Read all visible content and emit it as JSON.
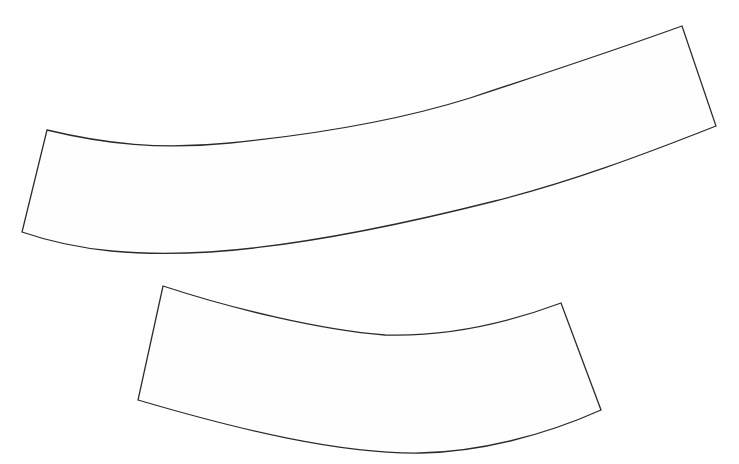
{
  "canvas": {
    "width": 739,
    "height": 464,
    "background": "#ffffff"
  },
  "style": {
    "stroke_color": "#2a2a2a",
    "fill_color": "#fefefe"
  },
  "shapes": [
    {
      "id": "upper-band",
      "description": "long curved band, rising to the right",
      "corners": {
        "top_left": [
          47,
          130
        ],
        "top_right": [
          682,
          26
        ],
        "bottom_right": [
          716,
          126
        ],
        "bottom_left": [
          22,
          232
        ]
      },
      "path": "M47,130 C105,144 160,150 230,143 C320,134 400,120 470,98 C540,75 610,52 682,26 L716,126 C640,156 570,182 495,201 C400,225 300,246 210,252 C140,256 80,252 22,232 Z"
    },
    {
      "id": "lower-band",
      "description": "shorter curved band, sagging in the middle",
      "corners": {
        "top_left": [
          163,
          286
        ],
        "top_right": [
          561,
          303
        ],
        "bottom_right": [
          601,
          410
        ],
        "bottom_left": [
          138,
          400
        ]
      },
      "path": "M163,286 C230,308 320,330 385,335 C450,337 510,322 561,303 L601,410 C545,435 480,452 420,453 C340,454 240,430 138,400 Z"
    }
  ]
}
